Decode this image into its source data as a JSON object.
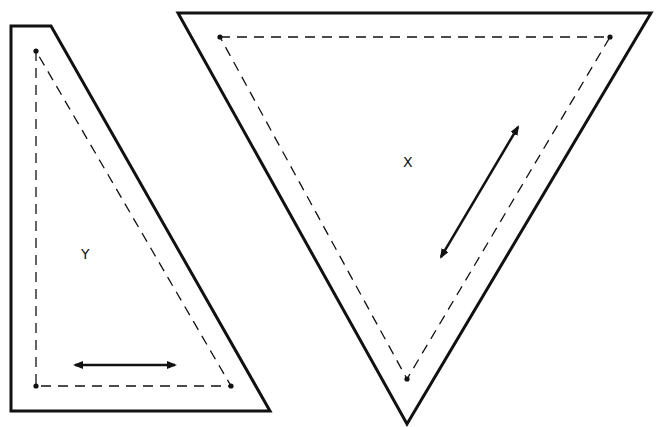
{
  "diagram": {
    "background": "#ffffff",
    "stroke_color": "#111111",
    "pieces": [
      {
        "id": "Y",
        "label": "Y",
        "shape": "right-trapezoid-triangle",
        "outer": [
          [
            11,
            26
          ],
          [
            51,
            26
          ],
          [
            270,
            411
          ],
          [
            11,
            411
          ]
        ],
        "seam_points": [
          [
            36,
            51
          ],
          [
            36,
            386
          ],
          [
            231,
            386
          ]
        ],
        "label_pos": [
          83,
          246
        ],
        "grain_arrow": {
          "from": [
            73,
            365
          ],
          "to": [
            177,
            365
          ],
          "direction": "horizontal"
        }
      },
      {
        "id": "X",
        "label": "X",
        "shape": "inverted-triangle",
        "outer": [
          [
            178,
            13
          ],
          [
            651,
            13
          ],
          [
            407,
            424
          ]
        ],
        "seam_points": [
          [
            220,
            37
          ],
          [
            610,
            37
          ],
          [
            407,
            379
          ]
        ],
        "label_pos": [
          404,
          154
        ],
        "grain_arrow": {
          "from": [
            440,
            259
          ],
          "to": [
            519,
            125
          ],
          "direction": "diagonal"
        }
      }
    ]
  }
}
